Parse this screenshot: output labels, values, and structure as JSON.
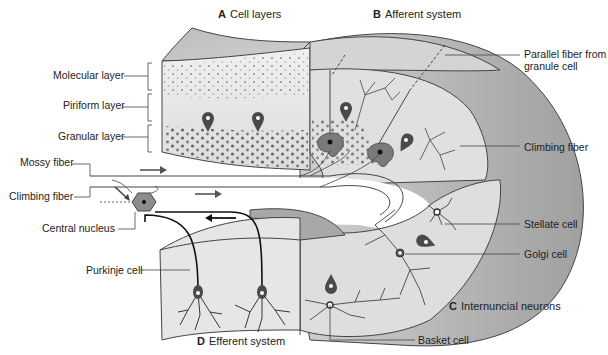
{
  "diagram": {
    "sections": [
      {
        "letter": "A",
        "title": "Cell layers"
      },
      {
        "letter": "B",
        "title": "Afferent system"
      },
      {
        "letter": "C",
        "title": "Internuncial neurons"
      },
      {
        "letter": "D",
        "title": "Efferent system"
      }
    ],
    "labels": {
      "molecular_layer": "Molecular layer",
      "piriform_layer": "Piriform layer",
      "granular_layer": "Granular layer",
      "mossy_fiber": "Mossy fiber",
      "climbing_fiber_left": "Climbing fiber",
      "central_nucleus": "Central nucleus",
      "purkinje_cell": "Purkinje cell",
      "parallel_fiber_line1": "Parallel fiber from",
      "parallel_fiber_line2": "granule cell",
      "climbing_fiber_right": "Climbing fiber",
      "stellate_cell": "Stellate cell",
      "golgi_cell": "Golgi cell",
      "basket_cell": "Basket cell"
    },
    "colors": {
      "tissue_light": "#e6e6e6",
      "tissue_mid": "#cfcfcf",
      "tissue_dark": "#a8a8a8",
      "cell_fill": "#555555",
      "nucleus_hex": "#8c8c8c",
      "line": "#333333"
    }
  }
}
